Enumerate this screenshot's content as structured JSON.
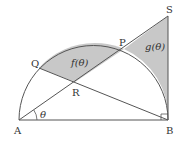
{
  "diagram": {
    "points": {
      "A": {
        "label": "A",
        "x": 19,
        "y": 120
      },
      "B": {
        "label": "B",
        "x": 168,
        "y": 120
      },
      "S": {
        "label": "S",
        "x": 168,
        "y": 16
      },
      "P": {
        "label": "P",
        "x": 124,
        "y": 49
      },
      "Q": {
        "label": "Q",
        "x": 39,
        "y": 68
      },
      "R": {
        "label": "R",
        "x": 75,
        "y": 82
      }
    },
    "angle_label": "θ",
    "region_f_label": "f(θ)",
    "region_g_label": "g(θ)",
    "colors": {
      "line": "#555555",
      "shade": "#c8c8c8",
      "background": "#ffffff"
    }
  }
}
